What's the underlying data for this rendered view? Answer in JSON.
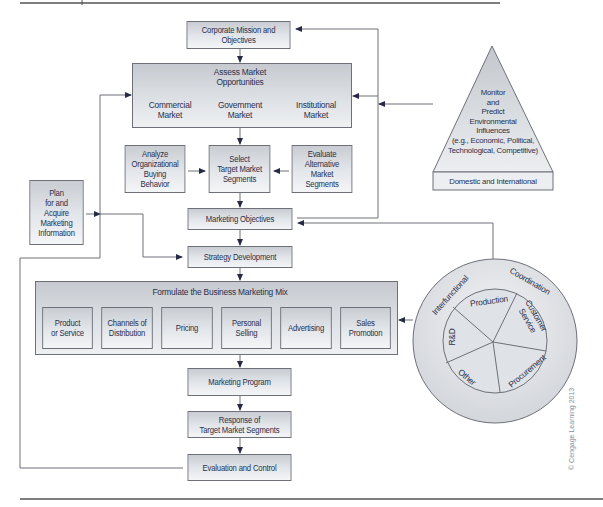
{
  "diagram": {
    "corporate": "Corporate Mission and\nObjectives",
    "assess": {
      "title": "Assess Market\nOpportunities",
      "commercial": "Commercial\nMarket",
      "government": "Government\nMarket",
      "institutional": "Institutional\nMarket"
    },
    "analyze": "Analyze\nOrganizational\nBuying\nBehavior",
    "select": "Select\nTarget Market\nSegments",
    "evaluate": "Evaluate\nAlternative\nMarket\nSegments",
    "plan": "Plan\nfor and\nAcquire\nMarketing\nInformation",
    "monitor": "Monitor\nand\nPredict\nEnvironmental\nInfluences\n(e.g., Economic, Political,\nTechnological, Competitive)",
    "domestic": "Domestic and International",
    "objectives": "Marketing Objectives",
    "strategy": "Strategy Development",
    "mix": {
      "title": "Formulate the Business Marketing Mix",
      "items": [
        "Product\nor Service",
        "Channels of\nDistribution",
        "Pricing",
        "Personal\nSelling",
        "Advertising",
        "Sales\nPromotion"
      ]
    },
    "circle": {
      "outer_left": "Interfunctional",
      "outer_right": "Coordination",
      "segments": [
        "Production",
        "Customer\nService",
        "Procurement",
        "Other",
        "R&D"
      ]
    },
    "program": "Marketing Program",
    "response": "Response of\nTarget Market Segments",
    "evaluation": "Evaluation and Control",
    "copyright": "© Cengage Learning 2013"
  }
}
